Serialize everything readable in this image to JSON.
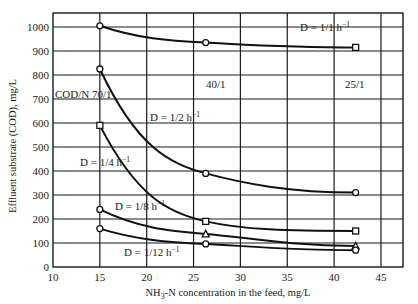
{
  "chart_data": {
    "type": "line",
    "title": "",
    "xlabel": "NH3-N concentration in the feed, mg/L",
    "ylabel": "Effluent substrate (COD), mg/L",
    "xlim": [
      10,
      47
    ],
    "ylim": [
      0,
      1050
    ],
    "xticks": [
      10,
      15,
      20,
      25,
      30,
      35,
      40,
      45
    ],
    "yticks": [
      0,
      100,
      200,
      300,
      400,
      500,
      600,
      700,
      800,
      900,
      1000
    ],
    "grid": true,
    "x": [
      15,
      26.3,
      42.3
    ],
    "series": [
      {
        "name": "D = 1/1 h⁻¹",
        "label": "D = 1/1 h",
        "values": [
          1005,
          935,
          915
        ],
        "marker": [
          "circle",
          "circle",
          "square"
        ]
      },
      {
        "name": "D = 1/2 h⁻¹",
        "label": "D = 1/2 h",
        "values": [
          825,
          390,
          310
        ],
        "marker": [
          "circle",
          "circle",
          "circle"
        ]
      },
      {
        "name": "D = 1/4 h⁻¹",
        "label": "D = 1/4 h",
        "values": [
          590,
          190,
          150
        ],
        "marker": [
          "square",
          "square",
          "square"
        ]
      },
      {
        "name": "D = 1/8 h⁻¹",
        "label": "D = 1/8 h",
        "values": [
          240,
          138,
          88
        ],
        "marker": [
          "circle",
          "triangle",
          "triangle"
        ]
      },
      {
        "name": "D = 1/12 h⁻¹",
        "label": "D = 1/12 h",
        "values": [
          160,
          96,
          70
        ],
        "marker": [
          "circle",
          "circle",
          "circle"
        ]
      }
    ],
    "annotations": [
      {
        "text": "COD/N 70/1",
        "x": 11.2,
        "y": 705
      },
      {
        "text": "40/1",
        "x": 27.4,
        "y": 660
      },
      {
        "text": "25/1",
        "x": 41.3,
        "y": 660
      }
    ]
  },
  "labels": {
    "d1": {
      "text": "D = 1/1 h",
      "sup": "−1"
    },
    "d2": {
      "text": "D = 1/2 h",
      "sup": "−1"
    },
    "d4": {
      "text": "D = 1/4 h",
      "sup": "−1"
    },
    "d8": {
      "text": "D = 1/8 h",
      "sup": "−1"
    },
    "d12": {
      "text": "D = 1/12 h",
      "sup": "−1"
    },
    "cod_70": "COD/N 70/1",
    "cod_40": "40/1",
    "cod_25": "25/1"
  },
  "axes": {
    "xlabel_main": "NH",
    "xlabel_sub": "3",
    "xlabel_rest": "-N concentration in the feed, mg/L",
    "ylabel": "Effluent substrate (COD), mg/L"
  }
}
